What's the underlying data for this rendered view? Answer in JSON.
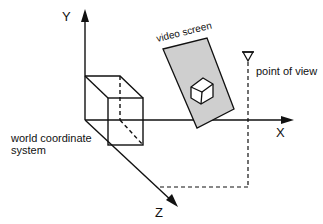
{
  "diagram": {
    "axes": {
      "y_label": "Y",
      "x_label": "X",
      "z_label": "Z"
    },
    "labels": {
      "world": "world coordinate",
      "world_line2": "system",
      "screen": "video screen",
      "viewpoint": "point of view"
    },
    "colors": {
      "line": "#111111",
      "screen_fill": "#cfcfcf"
    }
  }
}
